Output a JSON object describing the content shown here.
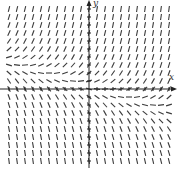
{
  "chart_data": {
    "type": "slope_field",
    "title": "",
    "xlabel": "x",
    "ylabel": "y",
    "grid": false,
    "xlim": [
      -11,
      11
    ],
    "ylim": [
      -11,
      11
    ],
    "grid_step": 1,
    "slope_description": "Slopes depend on both x and y: positive and steep in upper-right, near zero along a line slightly above the x-axis on the left and slightly below on the right, negative and steep toward the bottom",
    "slope_model": {
      "a_x": 0.18,
      "a_y": 0.6,
      "offset_y": 0.5
    },
    "segment_length": 6,
    "colors": {
      "segments": "#3a3a3a",
      "axes": "#222222"
    }
  },
  "axes": {
    "x_label": "x",
    "y_label": "y"
  }
}
